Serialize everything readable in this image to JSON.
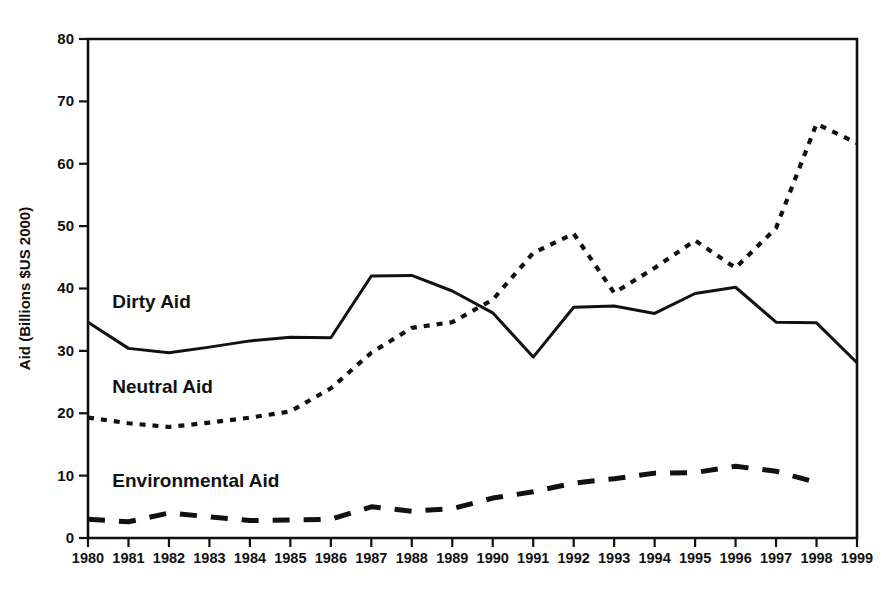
{
  "chart_data": {
    "type": "line",
    "title": "",
    "xlabel": "",
    "ylabel": "Aid (Billions $US 2000)",
    "xlim": [
      1980,
      1999
    ],
    "ylim": [
      0,
      80
    ],
    "ytick_values": [
      0,
      10,
      20,
      30,
      40,
      50,
      60,
      70,
      80
    ],
    "ytick_labels": [
      "0",
      "10",
      "20",
      "30",
      "40",
      "50",
      "60",
      "70",
      "80"
    ],
    "grid": false,
    "legend_position": "inline-annotations",
    "categories": [
      1980,
      1981,
      1982,
      1983,
      1984,
      1985,
      1986,
      1987,
      1988,
      1989,
      1990,
      1991,
      1992,
      1993,
      1994,
      1995,
      1996,
      1997,
      1998,
      1999
    ],
    "xtick_labels": [
      "1980",
      "1981",
      "1982",
      "1983",
      "1984",
      "1985",
      "1986",
      "1987",
      "1988",
      "1989",
      "1990",
      "1991",
      "1992",
      "1993",
      "1994",
      "1995",
      "1996",
      "1997",
      "1998",
      "1999"
    ],
    "series": [
      {
        "name": "Dirty Aid",
        "style": "solid",
        "label_x": 1980.6,
        "label_y": 36.8,
        "values": [
          34.6,
          30.4,
          29.7,
          30.6,
          31.6,
          32.2,
          32.1,
          42.0,
          42.1,
          39.6,
          36.1,
          29.0,
          37.0,
          37.2,
          36.0,
          39.2,
          40.2,
          34.6,
          34.5,
          28.1
        ]
      },
      {
        "name": "Neutral Aid",
        "style": "dotted",
        "label_x": 1980.6,
        "label_y": 23.2,
        "values": [
          19.3,
          18.4,
          17.8,
          18.5,
          19.3,
          20.3,
          24.0,
          29.7,
          33.7,
          34.6,
          38.2,
          45.7,
          48.8,
          39.3,
          43.3,
          47.7,
          43.3,
          49.7,
          66.4,
          63.3
        ]
      },
      {
        "name": "Environmental Aid",
        "style": "dashed",
        "label_x": 1980.6,
        "label_y": 8.2,
        "values": [
          3.0,
          2.6,
          4.0,
          3.4,
          2.8,
          2.9,
          3.0,
          5.0,
          4.3,
          4.7,
          6.4,
          7.4,
          8.8,
          9.5,
          10.4,
          10.5,
          11.5,
          10.7,
          8.9,
          null
        ]
      }
    ]
  },
  "plot_geometry": {
    "left": 88,
    "right": 857,
    "top": 39,
    "bottom": 538
  }
}
